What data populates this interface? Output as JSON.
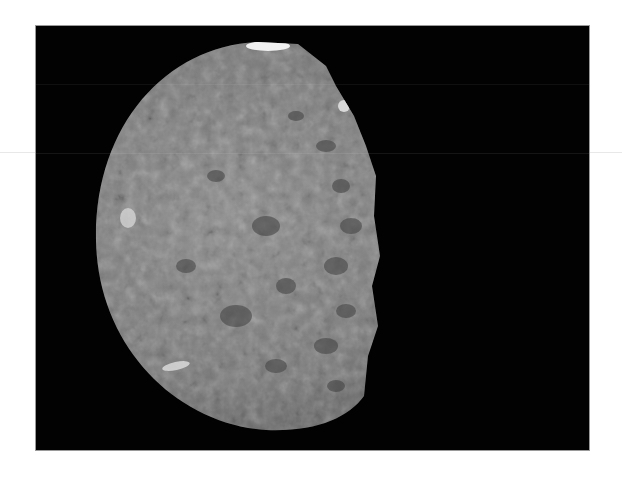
{
  "image": {
    "subject": "cratered moon, partially illuminated",
    "background_color": "#020202",
    "page_color": "#ffffff",
    "surface_color": "#8a8a8a",
    "highlight_color": "#e6e6e6",
    "frame": {
      "x": 35,
      "y": 25,
      "width": 555,
      "height": 426
    }
  }
}
